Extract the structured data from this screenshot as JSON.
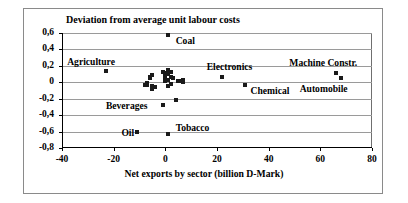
{
  "chart_data": {
    "type": "scatter",
    "title": "Deviation from average unit labour costs",
    "xlabel": "Net exports by sector (billion D-Mark)",
    "ylabel": "",
    "xlim": [
      -40,
      80
    ],
    "ylim": [
      -0.8,
      0.6
    ],
    "xticks": [
      "-40",
      "-20",
      "0",
      "20",
      "40",
      "60",
      "80"
    ],
    "xtick_values": [
      -40,
      -20,
      0,
      20,
      40,
      60,
      80
    ],
    "yticks": [
      "0,6",
      "0,4",
      "0,2",
      "0",
      "-0,2",
      "-0,4",
      "-0,6",
      "-0,8"
    ],
    "ytick_values": [
      0.6,
      0.4,
      0.2,
      0,
      -0.2,
      -0.4,
      -0.6,
      -0.8
    ],
    "grid": true,
    "legend": "none",
    "marker_color": "#1a1a1a",
    "labeled_points": [
      {
        "label": "Coal",
        "x": 1,
        "y": 0.57,
        "lx": 4,
        "ly": 0.5
      },
      {
        "label": "Agriculture",
        "x": -23,
        "y": 0.14,
        "lx": -38,
        "ly": 0.25
      },
      {
        "label": "Electronics",
        "x": 22,
        "y": 0.07,
        "lx": 16,
        "ly": 0.19
      },
      {
        "label": "Machine Constr.",
        "x": 66,
        "y": 0.11,
        "lx": 48,
        "ly": 0.24
      },
      {
        "label": "Automobile",
        "x": 68,
        "y": 0.055,
        "lx": 52,
        "ly": -0.08
      },
      {
        "label": "Chemical",
        "x": 31,
        "y": -0.03,
        "lx": 33,
        "ly": -0.11
      },
      {
        "label": "Beverages",
        "x": -1,
        "y": -0.28,
        "lx": -23,
        "ly": -0.29
      },
      {
        "label": "Oil",
        "x": -11,
        "y": -0.6,
        "lx": -17,
        "ly": -0.62
      },
      {
        "label": "Tobacco",
        "x": 1,
        "y": -0.63,
        "lx": 4,
        "ly": -0.56
      }
    ],
    "unlabeled_points": [
      {
        "x": 4,
        "y": -0.22
      },
      {
        "x": -6,
        "y": 0.07
      },
      {
        "x": -6,
        "y": 0.05
      },
      {
        "x": -5,
        "y": 0.09
      },
      {
        "x": -7,
        "y": -0.01
      },
      {
        "x": -7,
        "y": -0.03
      },
      {
        "x": -8,
        "y": -0.035
      },
      {
        "x": -5,
        "y": -0.05
      },
      {
        "x": -5,
        "y": -0.08
      },
      {
        "x": -4,
        "y": -0.06
      },
      {
        "x": -1,
        "y": 0.13
      },
      {
        "x": 0,
        "y": 0.115
      },
      {
        "x": 1,
        "y": 0.15
      },
      {
        "x": 1,
        "y": 0.1
      },
      {
        "x": 2,
        "y": 0.12
      },
      {
        "x": 2,
        "y": 0.07
      },
      {
        "x": 0,
        "y": 0.06
      },
      {
        "x": 0,
        "y": 0.02
      },
      {
        "x": 1,
        "y": 0.03
      },
      {
        "x": 1,
        "y": -0.04
      },
      {
        "x": 2,
        "y": -0.02
      },
      {
        "x": 3,
        "y": 0.05
      },
      {
        "x": 5,
        "y": 0.02
      },
      {
        "x": 6,
        "y": 0.01
      },
      {
        "x": 7,
        "y": 0.005
      },
      {
        "x": 7,
        "y": 0.03
      }
    ]
  }
}
